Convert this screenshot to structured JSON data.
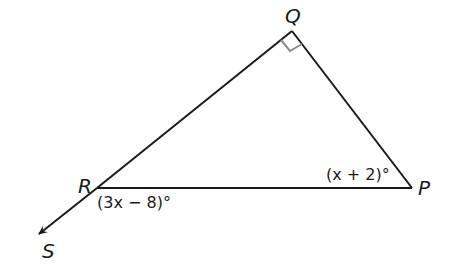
{
  "diagram": {
    "type": "triangle-with-exterior-ray",
    "vertices": {
      "Q": {
        "label": "Q",
        "x": 292,
        "y": 31
      },
      "R": {
        "label": "R",
        "x": 97,
        "y": 188
      },
      "P": {
        "label": "P",
        "x": 412,
        "y": 188
      },
      "S": {
        "label": "S",
        "x": 37,
        "y": 235
      }
    },
    "angle_labels": {
      "P": "(x + 2)°",
      "exterior_R": "(3x − 8)°"
    },
    "right_angle_at": "Q",
    "colors": {
      "line": "#1a1a1a",
      "right_angle_mark": "#8a8a8a"
    }
  }
}
